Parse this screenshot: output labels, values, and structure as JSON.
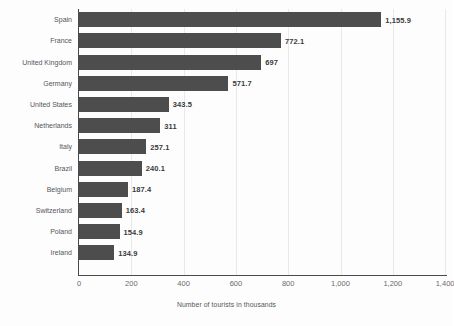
{
  "chart_data": {
    "type": "bar",
    "orientation": "horizontal",
    "title": "",
    "xlabel": "Number of tourists in thousands",
    "ylabel": "",
    "xlim": [
      0,
      1400
    ],
    "xticks": [
      "0",
      "200",
      "400",
      "600",
      "800",
      "1,000",
      "1,200",
      "1,400"
    ],
    "xtick_values": [
      0,
      200,
      400,
      600,
      800,
      1000,
      1200,
      1400
    ],
    "grid": true,
    "legend": false,
    "categories": [
      "Spain",
      "France",
      "United Kingdom",
      "Germany",
      "United States",
      "Netherlands",
      "Italy",
      "Brazil",
      "Belgium",
      "Switzerland",
      "Poland",
      "Ireland"
    ],
    "values": [
      1155.9,
      772.1,
      697,
      571.7,
      343.5,
      311,
      257.1,
      240.1,
      187.4,
      163.4,
      154.9,
      134.9
    ],
    "value_labels": [
      "1,155.9",
      "772.1",
      "697",
      "571.7",
      "343.5",
      "311",
      "257.1",
      "240.1",
      "187.4",
      "163.4",
      "154.9",
      "134.9"
    ],
    "bar_color": "#4d4d4d",
    "grid_color": "#e9e9e9",
    "axis_color": "#4a4a4a",
    "label_color": "#55565a",
    "value_label_color": "#3a3a3a",
    "background_color": "#fdfdfd"
  }
}
